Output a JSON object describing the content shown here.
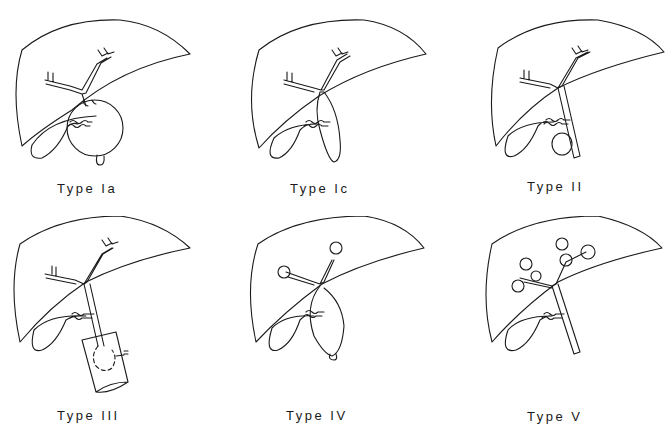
{
  "diagram": {
    "panels": [
      {
        "id": "type-ia",
        "label": "Type Ia",
        "feature": "cystic dilatation of common bile duct"
      },
      {
        "id": "type-ic",
        "label": "Type Ic",
        "feature": "fusiform dilatation of common bile duct"
      },
      {
        "id": "type-ii",
        "label": "Type II",
        "feature": "diverticulum of common bile duct"
      },
      {
        "id": "type-iii",
        "label": "Type III",
        "feature": "choledochocele within duodenal wall"
      },
      {
        "id": "type-iv",
        "label": "Type IV",
        "feature": "intra- and extrahepatic cysts"
      },
      {
        "id": "type-v",
        "label": "Type V",
        "feature": "multiple intrahepatic cysts (Caroli disease)"
      }
    ],
    "colors": {
      "background": "#ffffff",
      "stroke": "#1a1a1a"
    }
  }
}
